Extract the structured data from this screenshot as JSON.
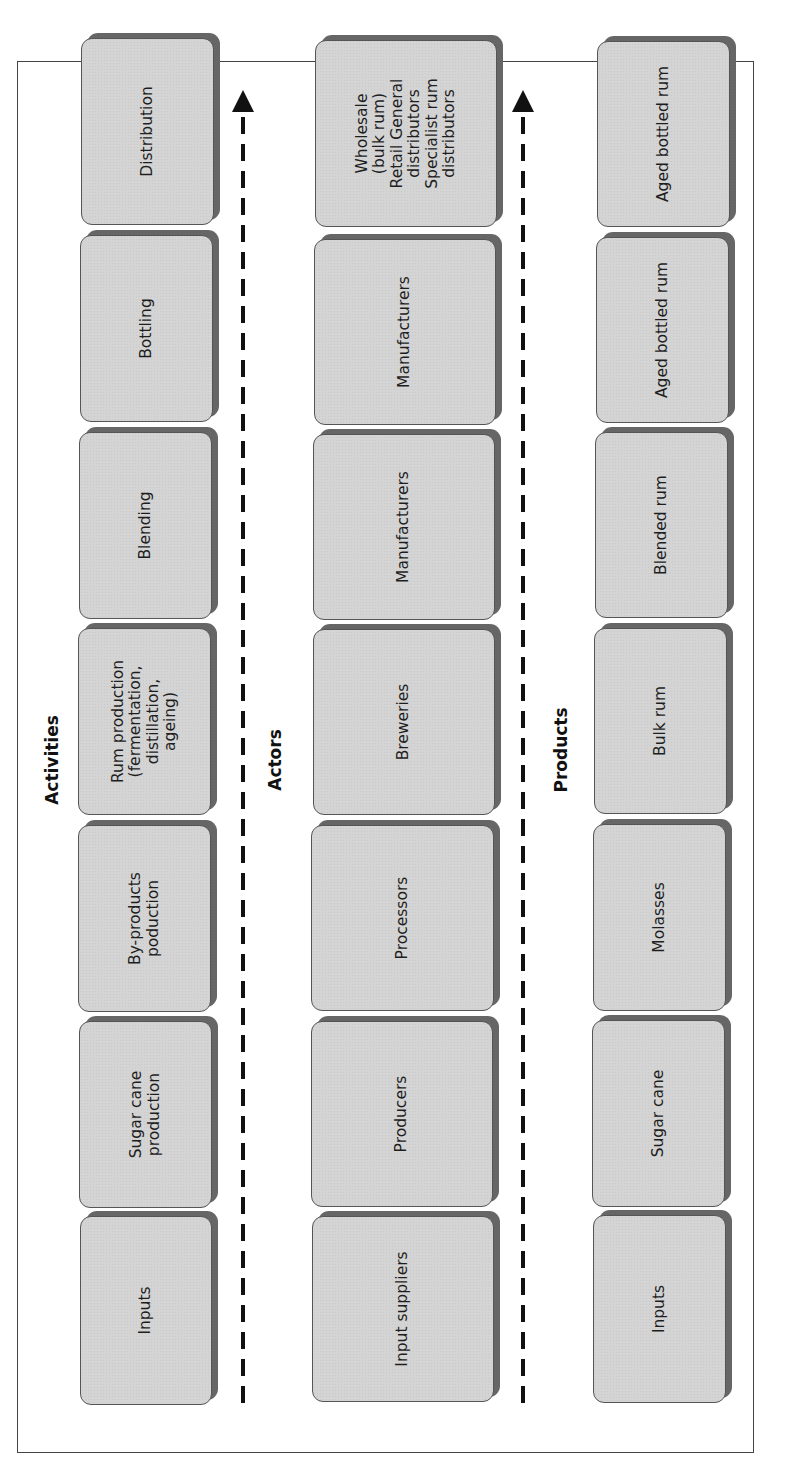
{
  "diagram": {
    "rows": [
      {
        "title": "Activities",
        "items": [
          "Inputs",
          "Sugar cane\nproduction",
          "By-products\npoduction",
          "Rum production\n(fermentation,\ndistillation,\nageing)",
          "Blending",
          "Bottling",
          "Distribution"
        ]
      },
      {
        "title": "Actors",
        "items": [
          "Input suppliers",
          "Producers",
          "Processors",
          "Breweries",
          "Manufacturers",
          "Manufacturers",
          "Wholesale\n(bulk rum)\nRetail General\ndistributors\nSpecialist rum\ndistributors"
        ]
      },
      {
        "title": "Products",
        "items": [
          "Inputs",
          "Sugar cane",
          "Molasses",
          "Bulk rum",
          "Blended rum",
          "Aged bottled rum",
          "Aged bottled rum"
        ]
      }
    ],
    "flow_direction": "left-to-right (rotated: bottom-to-top)",
    "colors": {
      "box_fill": "#d4d4d4",
      "box_border": "#555555",
      "box_shadow": "#666666",
      "arrow": "#111111",
      "frame": "#444444"
    }
  }
}
